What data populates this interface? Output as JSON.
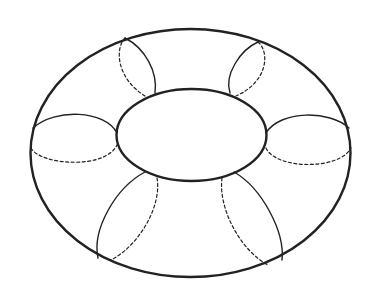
{
  "diagram": {
    "stroke_color": "#222222",
    "background": "#ffffff",
    "cross_sections": 6
  }
}
